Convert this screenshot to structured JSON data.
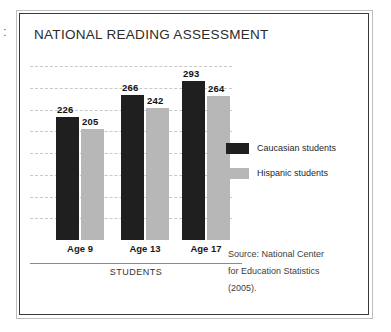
{
  "figure": {
    "title": "NATIONAL READING ASSESSMENT",
    "scan_mark": ":"
  },
  "legend": {
    "position": "right",
    "items": [
      {
        "label": "Caucasian students",
        "color": "#1f1f1f",
        "swatch_name": "legend-swatch-caucasian"
      },
      {
        "label": "Hispanic students",
        "color": "#b7b7b7",
        "swatch_name": "legend-swatch-hispanic"
      }
    ]
  },
  "source": {
    "lines": [
      "Source: National Center",
      "for Education Statistics",
      "(2005)."
    ]
  },
  "chart_data": {
    "type": "bar",
    "title": "NATIONAL READING ASSESSMENT",
    "subtitle": "",
    "xlabel": "STUDENTS",
    "ylabel": "",
    "categories": [
      "Age 9",
      "Age 13",
      "Age 17"
    ],
    "series": [
      {
        "name": "Caucasian students",
        "color": "#1f1f1f",
        "values": [
          226,
          266,
          293
        ]
      },
      {
        "name": "Hispanic students",
        "color": "#b7b7b7",
        "values": [
          205,
          242,
          264
        ]
      }
    ],
    "ylim": [
      0,
      320
    ],
    "grid": true,
    "gridlines": [
      40,
      80,
      120,
      160,
      200,
      240,
      280,
      320
    ],
    "legend_position": "right",
    "annotations": [
      "Source: National Center for Education Statistics (2005)."
    ]
  }
}
